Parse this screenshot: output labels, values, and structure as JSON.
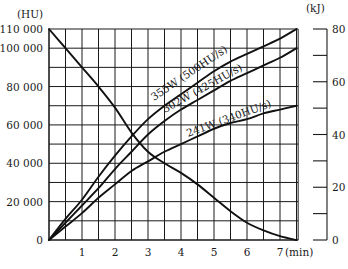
{
  "chart_data": {
    "type": "line",
    "title": "",
    "xlabel": "(min)",
    "ylabel": "(HU)",
    "ylabel_right": "(kJ)",
    "xlim": [
      0,
      7.55
    ],
    "ylim": [
      0,
      110000
    ],
    "ylim_right": [
      0,
      80
    ],
    "grid": true,
    "x_ticks": [
      1,
      2,
      3,
      4,
      5,
      6,
      7
    ],
    "x_tick_labels": [
      "1",
      "2",
      "3",
      "4",
      "5",
      "6",
      "7"
    ],
    "y_ticks": [
      0,
      20000,
      40000,
      60000,
      80000,
      100000,
      110000
    ],
    "y_tick_labels": [
      "0",
      "20 000",
      "40 000",
      "60 000",
      "80 000",
      "100 000",
      "110 000"
    ],
    "y_right_ticks": [
      0,
      10,
      20,
      30,
      40,
      50,
      60,
      70,
      80
    ],
    "y_right_tick_labels": [
      "0",
      "",
      "20",
      "",
      "40",
      "",
      "60",
      "",
      "80"
    ],
    "legend_position": "inline labels on curves",
    "series": [
      {
        "name": "355W (500HU/s)",
        "kind": "heating",
        "x": [
          0,
          0.5,
          1,
          1.5,
          2,
          2.5,
          3,
          3.5,
          4,
          4.5,
          5,
          5.5,
          6,
          6.5,
          7,
          7.5
        ],
        "values": [
          0,
          11000,
          21000,
          33000,
          44000,
          54000,
          63000,
          70000,
          76000,
          82000,
          88000,
          93000,
          97000,
          101000,
          105000,
          110000
        ]
      },
      {
        "name": "302W (425HU/s)",
        "kind": "heating",
        "x": [
          0,
          0.5,
          1,
          1.5,
          2,
          2.5,
          3,
          3.5,
          4,
          4.5,
          5,
          5.5,
          6,
          6.5,
          7,
          7.5
        ],
        "values": [
          0,
          9000,
          18000,
          27000,
          37000,
          46000,
          55000,
          62000,
          68000,
          73000,
          78000,
          83000,
          87000,
          91000,
          95000,
          100000
        ]
      },
      {
        "name": "241W (340HU/s)",
        "kind": "heating",
        "x": [
          0,
          0.5,
          1,
          1.5,
          2,
          2.5,
          3,
          3.5,
          4,
          4.5,
          5,
          5.5,
          6,
          6.5,
          7,
          7.5
        ],
        "values": [
          0,
          7000,
          14000,
          22000,
          29000,
          36000,
          41000,
          46000,
          50000,
          54000,
          58000,
          61000,
          63000,
          66000,
          68000,
          70000
        ]
      },
      {
        "name": "Cooling curve",
        "kind": "cooling",
        "x": [
          0,
          0.5,
          1,
          1.5,
          2,
          2.5,
          3,
          3.5,
          4,
          4.5,
          5,
          5.5,
          6,
          6.5,
          7,
          7.5
        ],
        "values": [
          110000,
          100000,
          90000,
          80000,
          69000,
          56000,
          46000,
          40000,
          35000,
          29000,
          22000,
          15000,
          9000,
          5000,
          2000,
          0
        ]
      }
    ]
  },
  "labels": {
    "y_unit_left": "(HU)",
    "y_unit_right": "(kJ)",
    "x_unit": "(min)",
    "curve_355": "355W (500HU/s)",
    "curve_302": "302W (425HU/s)",
    "curve_241": "241W (340HU/s)"
  }
}
